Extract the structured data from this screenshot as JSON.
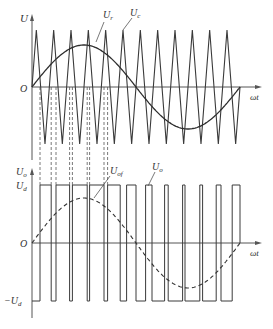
{
  "diagram": {
    "top_plot": {
      "y_axis_label": "U",
      "x_axis_label": "ωt",
      "origin_label": "O",
      "sine_label": "U_r",
      "sine_label_main": "U",
      "sine_label_sub": "r",
      "carrier_label": "U_c",
      "carrier_label_main": "U",
      "carrier_label_sub": "c",
      "carrier_periods": 12
    },
    "bottom_plot": {
      "y_axis_label": "U_o",
      "y_axis_label_main": "U",
      "y_axis_label_sub": "o",
      "x_axis_label": "ωt",
      "origin_label": "O",
      "pos_level_label": "U_d",
      "pos_level_main": "U",
      "pos_level_sub": "d",
      "neg_level_label": "−U_d",
      "neg_level_main": "−U",
      "neg_level_sub": "d",
      "fundamental_label": "U_of",
      "fundamental_main": "U",
      "fundamental_sub": "of",
      "output_label": "U_o",
      "output_main": "U",
      "output_sub": "o"
    },
    "colors": {
      "line": "#3a3a3a",
      "dashed": "#444444",
      "axis": "#555555"
    }
  }
}
